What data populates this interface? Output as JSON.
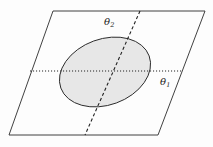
{
  "figure": {
    "name": "parameter-plane-with-ellipse",
    "background_color": "#fdfdfd",
    "line_color": "#2b2b2b",
    "ellipse_fill": "#e6e6e6",
    "ellipse_stroke": "#2b2b2b"
  },
  "plane": {
    "name": "parallelogram-plane",
    "corners": [
      {
        "label": "top-left",
        "x": 53,
        "y": 11
      },
      {
        "label": "top-right",
        "x": 205,
        "y": 11
      },
      {
        "label": "bottom-right",
        "x": 158,
        "y": 135
      },
      {
        "label": "bottom-left",
        "x": 9,
        "y": 135
      }
    ]
  },
  "region": {
    "name": "shaded-ellipse",
    "center_x": 105,
    "center_y": 72,
    "radius_x": 47,
    "radius_y": 33,
    "rotation_deg": -20
  },
  "axes": [
    {
      "id": "theta1",
      "label_main": "θ",
      "label_sub": "1",
      "style": "dotted",
      "x1": 30,
      "y1": 71,
      "x2": 182,
      "y2": 71,
      "label_x": 160,
      "label_y": 77
    },
    {
      "id": "theta2",
      "label_main": "θ",
      "label_sub": "2",
      "style": "dashed",
      "x1": 140,
      "y1": 11,
      "x2": 85,
      "y2": 135,
      "label_x": 104,
      "label_y": 17
    }
  ],
  "labels": {
    "theta1": {
      "glyph": "θ",
      "subscript": "1"
    },
    "theta2": {
      "glyph": "θ",
      "subscript": "2"
    }
  }
}
